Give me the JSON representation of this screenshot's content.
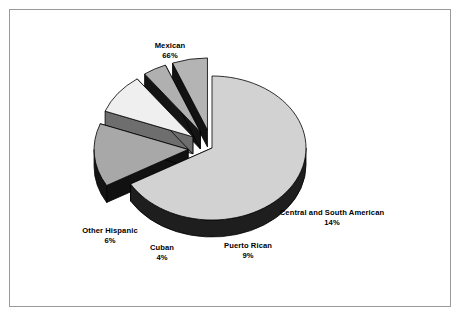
{
  "figure": {
    "border_color": "#9a9a9a",
    "background": "#ffffff"
  },
  "chart_data": {
    "type": "pie",
    "title": "",
    "subtitle": "",
    "xlabel": "",
    "ylabel": "",
    "legend_position": "none",
    "grid": false,
    "three_d": true,
    "exploded": true,
    "labels_show_value": true,
    "value_suffix": "%",
    "categories": [
      "Mexican",
      "Central and South American",
      "Puerto Rican",
      "Cuban",
      "Other Hispanic"
    ],
    "values": [
      66,
      14,
      9,
      4,
      6
    ],
    "slices": [
      {
        "name": "Mexican",
        "value": 66,
        "value_text": "66%",
        "color": "#d2d2d2",
        "side_color": "#1a1a1a",
        "exploded": false,
        "label_x": 170,
        "label_y": 41
      },
      {
        "name": "Central and South American",
        "value": 14,
        "value_text": "14%",
        "color": "#a8a8a8",
        "side_color": "#111111",
        "exploded": true,
        "label_x": 332,
        "label_y": 208
      },
      {
        "name": "Puerto Rican",
        "value": 9,
        "value_text": "9%",
        "color": "#efefef",
        "side_color": "#6e6e6e",
        "exploded": true,
        "label_x": 248,
        "label_y": 241
      },
      {
        "name": "Cuban",
        "value": 4,
        "value_text": "4%",
        "color": "#b0b0b0",
        "side_color": "#141414",
        "exploded": true,
        "label_x": 162,
        "label_y": 243
      },
      {
        "name": "Other Hispanic",
        "value": 6,
        "value_text": "6%",
        "color": "#b4b4b4",
        "side_color": "#121212",
        "exploded": true,
        "label_x": 110,
        "label_y": 226
      }
    ]
  }
}
